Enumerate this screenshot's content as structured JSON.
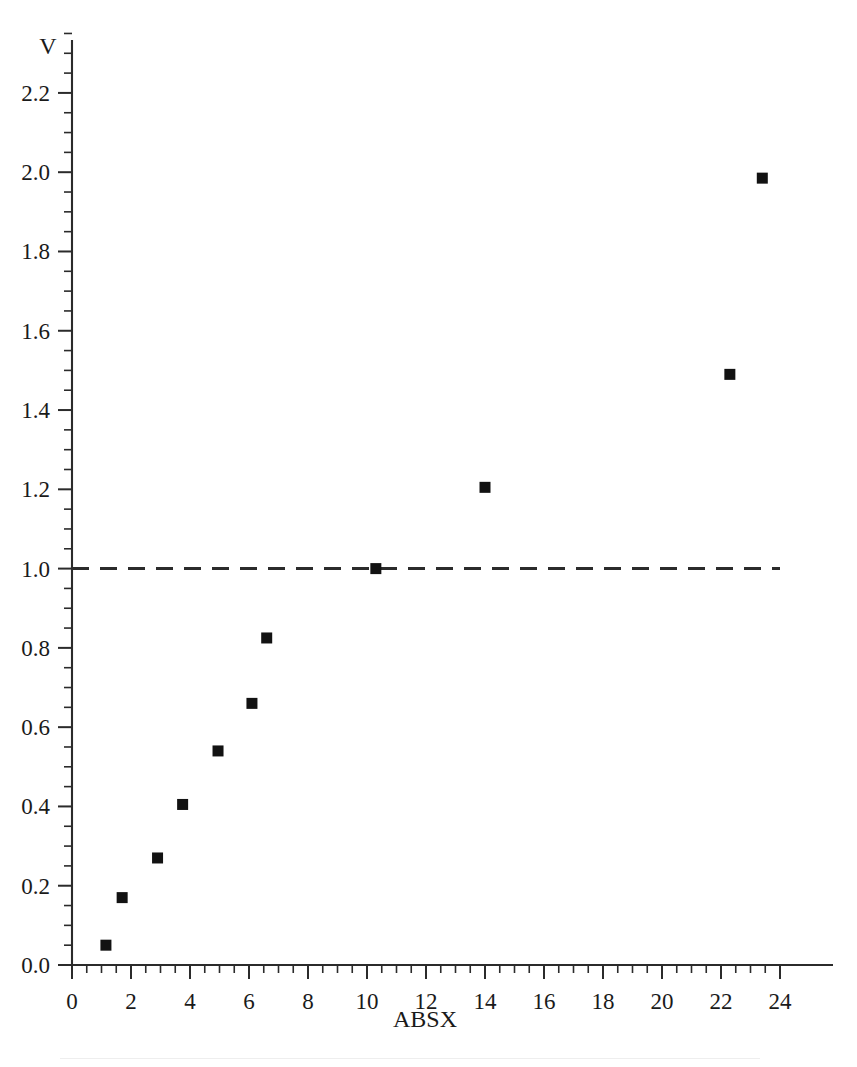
{
  "chart_data": {
    "type": "scatter",
    "title": "",
    "xlabel": "ABSX",
    "ylabel": "V",
    "xlim": [
      0,
      24
    ],
    "ylim": [
      0,
      2.2
    ],
    "grid": false,
    "legend": null,
    "x_ticks": [
      "0",
      "2",
      "4",
      "6",
      "8",
      "10",
      "12",
      "14",
      "16",
      "18",
      "20",
      "22",
      "24"
    ],
    "x_tick_values": [
      0,
      2,
      4,
      6,
      8,
      10,
      12,
      14,
      16,
      18,
      20,
      22,
      24
    ],
    "x_minor_interval": 0.5,
    "y_ticks": [
      "0.0",
      "0.2",
      "0.4",
      "0.6",
      "0.8",
      "1.0",
      "1.2",
      "1.4",
      "1.6",
      "1.8",
      "2.0",
      "2.2"
    ],
    "y_tick_values": [
      0.0,
      0.2,
      0.4,
      0.6,
      0.8,
      1.0,
      1.2,
      1.4,
      1.6,
      1.8,
      2.0,
      2.2
    ],
    "y_minor_interval": 0.05,
    "marker": "filled-square",
    "marker_color": "#121212",
    "points": [
      {
        "x": 1.15,
        "y": 0.05
      },
      {
        "x": 1.7,
        "y": 0.17
      },
      {
        "x": 2.9,
        "y": 0.27
      },
      {
        "x": 3.75,
        "y": 0.405
      },
      {
        "x": 4.95,
        "y": 0.54
      },
      {
        "x": 6.1,
        "y": 0.66
      },
      {
        "x": 6.6,
        "y": 0.825
      },
      {
        "x": 10.3,
        "y": 1.0
      },
      {
        "x": 14.0,
        "y": 1.205
      },
      {
        "x": 22.3,
        "y": 1.49
      },
      {
        "x": 23.4,
        "y": 1.985
      }
    ],
    "annotations": [
      {
        "type": "hline",
        "y": 1.0,
        "style": "dashed",
        "x_from": 0,
        "x_to": 24,
        "color": "#2b2b2b"
      }
    ]
  }
}
